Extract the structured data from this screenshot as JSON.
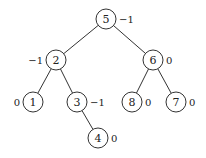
{
  "diagram": {
    "type": "binary-tree",
    "nodes": [
      {
        "id": "n5",
        "label": "5",
        "balance": "−1",
        "x": 106,
        "y": 19,
        "bf_side": "right"
      },
      {
        "id": "n2",
        "label": "2",
        "balance": "−1",
        "x": 56,
        "y": 60,
        "bf_side": "left"
      },
      {
        "id": "n6",
        "label": "6",
        "balance": "0",
        "x": 153,
        "y": 60,
        "bf_side": "right"
      },
      {
        "id": "n1",
        "label": "1",
        "balance": "0",
        "x": 33,
        "y": 102,
        "bf_side": "left"
      },
      {
        "id": "n3",
        "label": "3",
        "balance": "−1",
        "x": 77,
        "y": 102,
        "bf_side": "right"
      },
      {
        "id": "n8",
        "label": "8",
        "balance": "0",
        "x": 132,
        "y": 102,
        "bf_side": "right"
      },
      {
        "id": "n7",
        "label": "7",
        "balance": "0",
        "x": 176,
        "y": 102,
        "bf_side": "right"
      },
      {
        "id": "n4",
        "label": "4",
        "balance": "0",
        "x": 98,
        "y": 138,
        "bf_side": "right"
      }
    ],
    "edges": [
      {
        "from": "n5",
        "to": "n2"
      },
      {
        "from": "n5",
        "to": "n6"
      },
      {
        "from": "n2",
        "to": "n1"
      },
      {
        "from": "n2",
        "to": "n3"
      },
      {
        "from": "n6",
        "to": "n8"
      },
      {
        "from": "n6",
        "to": "n7"
      },
      {
        "from": "n3",
        "to": "n4"
      }
    ],
    "node_radius": 10
  }
}
